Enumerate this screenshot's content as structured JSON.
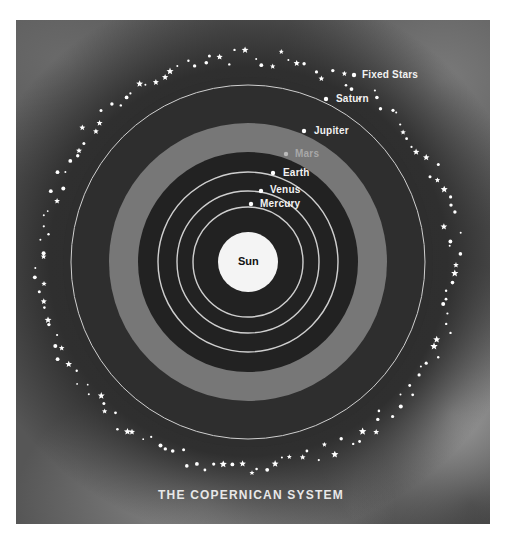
{
  "diagram": {
    "caption": "THE COPERNICAN SYSTEM",
    "center": [
      248,
      262
    ],
    "sun": {
      "label": "Sun",
      "radius": 30,
      "color": "#f4f4f4"
    },
    "orbits": [
      {
        "name": "Mercury",
        "radius": 55
      },
      {
        "name": "Venus",
        "radius": 71
      },
      {
        "name": "Earth",
        "radius": 90
      },
      {
        "name": "Saturn",
        "radius": 177
      }
    ],
    "jupiter_band": {
      "inner": 110,
      "outer": 139,
      "color": "#777777"
    },
    "inner_disk_color": "#222222",
    "outer_disk_color": "#2e2e2e",
    "orbit_line_color": "#cfcfcf",
    "star_ring": {
      "radius": 207,
      "count": 150,
      "color": "#ffffff"
    },
    "planets": [
      {
        "name": "Fixed Stars",
        "dot": [
          354,
          75
        ],
        "label_pos": [
          362,
          70
        ],
        "dim": false
      },
      {
        "name": "Saturn",
        "dot": [
          326,
          99
        ],
        "label_pos": [
          336,
          94
        ],
        "dim": false
      },
      {
        "name": "Jupiter",
        "dot": [
          304,
          131
        ],
        "label_pos": [
          314,
          126
        ],
        "dim": false
      },
      {
        "name": "Mars",
        "dot": [
          286,
          154
        ],
        "label_pos": [
          295,
          149
        ],
        "dim": true
      },
      {
        "name": "Earth",
        "dot": [
          273,
          173
        ],
        "label_pos": [
          283,
          168
        ],
        "dim": false
      },
      {
        "name": "Venus",
        "dot": [
          261,
          191
        ],
        "label_pos": [
          270,
          185
        ],
        "dim": false
      },
      {
        "name": "Mercury",
        "dot": [
          251,
          204
        ],
        "label_pos": [
          260,
          199
        ],
        "dim": false
      }
    ]
  }
}
